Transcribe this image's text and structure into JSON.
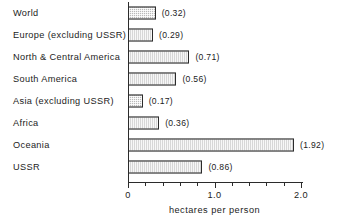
{
  "chart_data": {
    "type": "bar",
    "orientation": "horizontal",
    "title": "",
    "xlabel": "hectares per person",
    "ylabel": "",
    "xlim": [
      0,
      2.0
    ],
    "xticks": [
      0,
      1.0,
      2.0
    ],
    "xtick_labels": [
      "0",
      "1.0",
      "2.0"
    ],
    "minor_tick_step": 0.2,
    "grid": false,
    "legend": null,
    "value_label_format": "(v)",
    "categories": [
      "World",
      "Europe (excluding USSR)",
      "North & Central America",
      "South America",
      "Asia (excluding USSR)",
      "Africa",
      "Oceania",
      "USSR"
    ],
    "values": [
      0.32,
      0.29,
      0.71,
      0.56,
      0.17,
      0.36,
      1.92,
      0.86
    ],
    "value_labels": [
      "(0.32)",
      "(0.29)",
      "(0.71)",
      "(0.56)",
      "(0.17)",
      "(0.36)",
      "(1.92)",
      "(0.86)"
    ],
    "colors": {
      "bar_fill": "#b9b9b9",
      "bar_edge": "#2b2b2b",
      "axis": "#2b2b2b",
      "text": "#1c1c1c",
      "background": "#ffffff"
    }
  }
}
